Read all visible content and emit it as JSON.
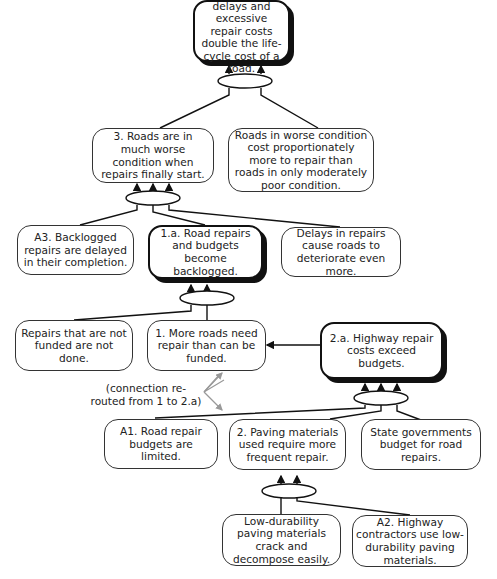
{
  "diagram": {
    "type": "current reality tree",
    "nodes": {
      "n3a": {
        "text": "3.a. Repair delays and excessive repair costs double the life-cycle cost of a road.",
        "emphasis": true
      },
      "n3": {
        "text": "3. Roads are in much worse condition when repairs finally start.",
        "emphasis": false
      },
      "worse_cost": {
        "text": "Roads in worse condition cost proportionately more to repair than roads in only moderately poor condition.",
        "emphasis": false
      },
      "a3": {
        "text": "A3. Backlogged repairs are delayed in their completion.",
        "emphasis": false
      },
      "n1a": {
        "text": "1.a. Road repairs and budgets become backlogged.",
        "emphasis": true
      },
      "delays": {
        "text": "Delays in repairs cause roads to deteriorate even more.",
        "emphasis": false
      },
      "not_funded": {
        "text": "Repairs that are not funded are not done.",
        "emphasis": false
      },
      "n1": {
        "text": "1. More roads need repair than can be funded.",
        "emphasis": false
      },
      "n2a": {
        "text": "2.a. Highway repair costs exceed budgets.",
        "emphasis": true
      },
      "a1": {
        "text": "A1. Road repair budgets are limited.",
        "emphasis": false
      },
      "n2": {
        "text": "2. Paving materials used require more frequent repair.",
        "emphasis": false
      },
      "state": {
        "text": "State governments budget for road repairs.",
        "emphasis": false
      },
      "low_dur": {
        "text": "Low-durability paving materials crack and decompose easily.",
        "emphasis": false
      },
      "a2": {
        "text": "A2. Highway contractors use low-durability paving materials.",
        "emphasis": false
      }
    },
    "annotation": "(connection re-routed from 1 to 2.a)",
    "edges": [
      {
        "and_group": [
          "n3",
          "worse_cost"
        ],
        "to": "n3a"
      },
      {
        "and_group": [
          "a3",
          "n1a",
          "delays"
        ],
        "to": "n3"
      },
      {
        "and_group": [
          "not_funded",
          "n1"
        ],
        "to": "n1a"
      },
      {
        "from": "n2a",
        "to": "n1"
      },
      {
        "and_group": [
          "a1",
          "n2",
          "state"
        ],
        "to": "n2a"
      },
      {
        "and_group": [
          "low_dur",
          "a2"
        ],
        "to": "n2"
      }
    ],
    "colors": {
      "line": "#111111",
      "reroute_arrow": "#999999",
      "background": "#ffffff"
    }
  }
}
